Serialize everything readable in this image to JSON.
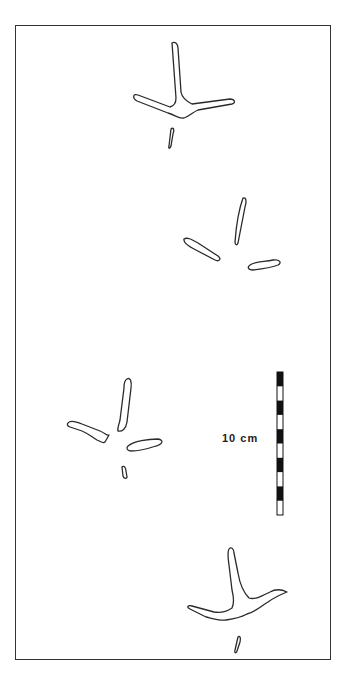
{
  "figure": {
    "type": "trackway-diagram",
    "scale_bar": {
      "label": "10 cm",
      "segments": 10,
      "colors": {
        "dark": "#111111",
        "light": "#ffffff"
      }
    },
    "footprints": [
      {
        "id": "print-1",
        "description": "three-toed footprint with hallux"
      },
      {
        "id": "print-2",
        "description": "separated toe impressions"
      },
      {
        "id": "print-3",
        "description": "three-toed footprint with hallux"
      },
      {
        "id": "print-4",
        "description": "three-toed footprint with hallux"
      }
    ],
    "line_color": "#2a2a2a"
  }
}
